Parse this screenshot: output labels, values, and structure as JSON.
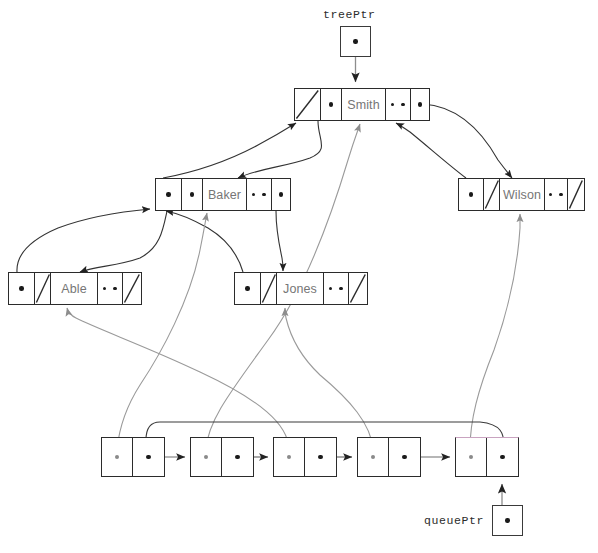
{
  "diagram": {
    "background_color": "#ffffff",
    "stroke_color": "#2b2b2b",
    "edge_color": "#555555",
    "label_text_color": "#767676",
    "highlight_color": "#c9a3c0"
  },
  "pointers": [
    {
      "id": "treePtr",
      "label": "treePtr",
      "box": {
        "x": 340,
        "y": 26,
        "w": 31,
        "h": 31
      },
      "label_pos": {
        "x": 323,
        "y": 9
      },
      "target": "smith"
    },
    {
      "id": "queuePtr",
      "label": "queuePtr",
      "box": {
        "x": 492,
        "y": 505,
        "w": 31,
        "h": 31
      },
      "label_pos": {
        "x": 424,
        "y": 513
      },
      "target": "queue-node-5"
    }
  ],
  "tree_nodes": [
    {
      "id": "smith",
      "name": "Smith",
      "x": 294,
      "y": 88,
      "w": 136,
      "h": 33,
      "cells": [
        {
          "kind": "slash",
          "w": 26
        },
        {
          "kind": "dot",
          "w": 22
        },
        {
          "kind": "name",
          "w": 44
        },
        {
          "kind": "dots",
          "w": 26
        },
        {
          "kind": "dot",
          "w": 18
        }
      ]
    },
    {
      "id": "baker",
      "name": "Baker",
      "x": 155,
      "y": 178,
      "w": 136,
      "h": 33,
      "cells": [
        {
          "kind": "dot",
          "w": 26
        },
        {
          "kind": "dot",
          "w": 22
        },
        {
          "kind": "name",
          "w": 44
        },
        {
          "kind": "dots",
          "w": 26
        },
        {
          "kind": "dot",
          "w": 18
        }
      ]
    },
    {
      "id": "wilson",
      "name": "Wilson",
      "x": 458,
      "y": 178,
      "w": 127,
      "h": 33,
      "cells": [
        {
          "kind": "dot",
          "w": 25
        },
        {
          "kind": "slash",
          "w": 17
        },
        {
          "kind": "name",
          "w": 45
        },
        {
          "kind": "dots",
          "w": 24
        },
        {
          "kind": "slash",
          "w": 16
        }
      ]
    },
    {
      "id": "able",
      "name": "Able",
      "x": 8,
      "y": 272,
      "w": 134,
      "h": 33,
      "cells": [
        {
          "kind": "dot",
          "w": 26
        },
        {
          "kind": "slash",
          "w": 17
        },
        {
          "kind": "name",
          "w": 47
        },
        {
          "kind": "dots",
          "w": 26
        },
        {
          "kind": "slash",
          "w": 18
        }
      ]
    },
    {
      "id": "jones",
      "name": "Jones",
      "x": 234,
      "y": 272,
      "w": 134,
      "h": 33,
      "cells": [
        {
          "kind": "dot",
          "w": 26
        },
        {
          "kind": "slash",
          "w": 17
        },
        {
          "kind": "name",
          "w": 47
        },
        {
          "kind": "dots",
          "w": 26
        },
        {
          "kind": "slash",
          "w": 18
        }
      ]
    }
  ],
  "queue_nodes": [
    {
      "id": "queue-node-1",
      "x": 101,
      "y": 437,
      "w": 64,
      "h": 40,
      "highlight": false
    },
    {
      "id": "queue-node-2",
      "x": 190,
      "y": 437,
      "w": 64,
      "h": 40,
      "highlight": false
    },
    {
      "id": "queue-node-3",
      "x": 273,
      "y": 437,
      "w": 64,
      "h": 40,
      "highlight": false
    },
    {
      "id": "queue-node-4",
      "x": 357,
      "y": 437,
      "w": 64,
      "h": 40,
      "highlight": false
    },
    {
      "id": "queue-node-5",
      "x": 455,
      "y": 437,
      "w": 64,
      "h": 40,
      "highlight": true
    }
  ],
  "edges": {
    "pointer_links": [
      {
        "from": "treePtr",
        "to": "smith",
        "path": "M355,57 L355,83"
      },
      {
        "from": "queuePtr",
        "to": "queue-node-5",
        "path": "M502,505 L502,483"
      }
    ],
    "tree_links": [
      {
        "from": "smith-left",
        "to": "baker",
        "path": "M318,118 C318,150 300,168 270,188",
        "note": "Smith left child to Baker"
      },
      {
        "from": "smith-right",
        "to": "wilson",
        "path": "M424,104 C470,112 500,140 520,172",
        "note": "Smith right child to Wilson"
      },
      {
        "from": "baker-left",
        "to": "able",
        "path": "M166,208 C160,240 130,268 104,285",
        "note": "Baker left child to Able"
      },
      {
        "from": "baker-right",
        "to": "jones",
        "path": "M275,208 C272,235 268,255 262,268",
        "note": "Baker right child to Jones"
      }
    ],
    "queue_to_tree_links": [
      {
        "from": "queue-node-1",
        "to": "baker",
        "path": "M118,443 C120,400 60,340 40,290"
      },
      {
        "from": "queue-node-2",
        "to": "baker",
        "path": "M208,443 C212,370 200,300 186,212"
      },
      {
        "from": "queue-node-3",
        "to": "able",
        "path": "M290,443 C290,380 220,300 72,308"
      },
      {
        "from": "queue-node-4",
        "to": "jones",
        "path": "M375,443 C368,380 330,300 282,308"
      },
      {
        "from": "queue-node-5",
        "to": "wilson",
        "path": "M472,443 C478,380 520,290 521,214"
      }
    ],
    "parent_back_links": [
      {
        "from": "baker",
        "to": "smith",
        "path": "M200,178 C210,150 250,128 300,122"
      },
      {
        "from": "wilson",
        "to": "smith",
        "path": "M476,178 C455,155 420,132 400,123"
      },
      {
        "from": "able",
        "to": "baker",
        "path": "M40,272 C45,250 80,222 152,208"
      },
      {
        "from": "jones",
        "to": "baker",
        "path": "M262,272 C250,250 215,222 190,208"
      }
    ]
  },
  "legend": {
    "slash_meaning": "null pointer",
    "dot_meaning": "pointer to another node",
    "dots_meaning": "additional record data"
  }
}
